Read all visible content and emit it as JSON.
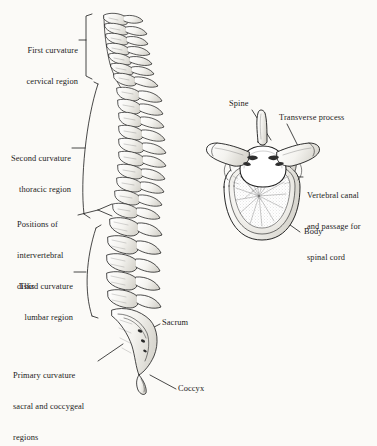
{
  "figure": {
    "background_color": "#fbfaf7",
    "ink_color": "#1a1a1a",
    "illustration_style": "engraved line drawing with stipple shading"
  },
  "spine_panel": {
    "name": "lateral view of vertebral column",
    "labels": {
      "cervical": {
        "lines": [
          "First curvature",
          "cervical region"
        ],
        "line1": "First curvature",
        "line2": "cervical region",
        "leader": "bracket"
      },
      "thoracic": {
        "lines": [
          "Second curvature",
          "thoracic region"
        ],
        "line1": "Second curvature",
        "line2": "thoracic region",
        "leader": "bracket"
      },
      "disks": {
        "lines": [
          "Positions of",
          "intervertebral",
          "disks"
        ],
        "line1": "Positions of",
        "line2": "intervertebral",
        "line3": "disks",
        "leader": "forked"
      },
      "lumbar": {
        "lines": [
          "Third curvature",
          "lumbar region"
        ],
        "line1": "Third curvature",
        "line2": "lumbar region",
        "leader": "bracket"
      },
      "primary": {
        "lines": [
          "Primary curvature",
          "sacral and coccygeal",
          "regions"
        ],
        "line1": "Primary curvature",
        "line2": "sacral and coccygeal",
        "line3": "regions",
        "leader": "line"
      },
      "sacrum": {
        "text": "Sacrum",
        "leader": "line"
      },
      "coccyx": {
        "text": "Coccyx",
        "leader": "line"
      }
    }
  },
  "vertebra_panel": {
    "name": "superior view of a thoracic vertebra",
    "labels": {
      "spine": {
        "text": "Spine",
        "leader": "line"
      },
      "transverse_process": {
        "text": "Transverse process",
        "leader": "line"
      },
      "vertebral_canal": {
        "lines": [
          "Vertebral canal",
          "and passage for",
          "spinal cord"
        ],
        "line1": "Vertebral canal",
        "line2": "and passage for",
        "line3": "spinal cord",
        "leader": "line"
      },
      "body": {
        "text": "Body",
        "leader": "line"
      }
    }
  }
}
